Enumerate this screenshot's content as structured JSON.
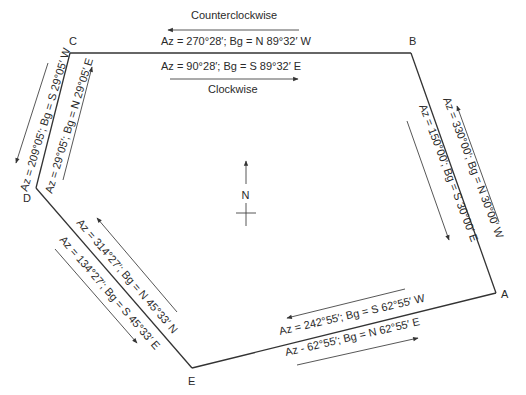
{
  "vertices": {
    "A": {
      "label": "A"
    },
    "B": {
      "label": "B"
    },
    "C": {
      "label": "C"
    },
    "D": {
      "label": "D"
    },
    "E": {
      "label": "E"
    }
  },
  "north_arrow": {
    "label": "N"
  },
  "edges": {
    "BC": {
      "counterclockwise_label": "Counterclockwise",
      "clockwise_label": "Clockwise",
      "outer": "Az = 270°28′; Bg = N 89°32′ W",
      "inner": "Az = 90°28′; Bg = S 89°32′ E"
    },
    "CD": {
      "outer": "Az = 209°05′; Bg = S 29°05′ W",
      "inner": "Az = 29°05′; Bg = N 29°05′ E"
    },
    "BA": {
      "outer": "Az = 330°00′; Bg = N 30°00′ W",
      "inner": "Az = 150°00′; Bg = S 30°00′ E"
    },
    "DE": {
      "outer": "Az = 314°27′; Bg = N 45°33′ N",
      "inner": "Az = 134°27′; Bg = S 45°33′ E"
    },
    "EA": {
      "outer": "Az = 242°55′; Bg = S 62°55′ W",
      "inner": "Az - 62°55′; Bg = N 62°55′ E"
    }
  }
}
